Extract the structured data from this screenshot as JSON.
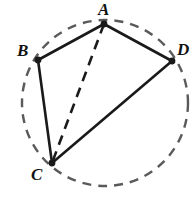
{
  "figure": {
    "name": "cyclic-quadrilateral-with-diagonal",
    "width": 193,
    "height": 197,
    "background_color": "#ffffff",
    "circle": {
      "name": "circumscribed-circle",
      "style": "dashed",
      "color": "#5a5a5a",
      "stroke_width": 2.4,
      "dash_pattern": "9 7",
      "center_x": 105,
      "center_y": 103,
      "radius": 83
    },
    "vertices": [
      {
        "id": "A",
        "label": "A",
        "x": 104,
        "y": 24,
        "label_x": 98,
        "label_y": 1,
        "dot_radius": 3.4,
        "color": "#1a1a1a"
      },
      {
        "id": "B",
        "label": "B",
        "x": 38,
        "y": 60,
        "label_x": 17,
        "label_y": 42,
        "dot_radius": 3.4,
        "color": "#1a1a1a"
      },
      {
        "id": "C",
        "label": "C",
        "x": 52,
        "y": 163,
        "label_x": 31,
        "label_y": 166,
        "dot_radius": 3.4,
        "color": "#1a1a1a"
      },
      {
        "id": "D",
        "label": "D",
        "x": 172,
        "y": 61,
        "label_x": 177,
        "label_y": 41,
        "dot_radius": 3.4,
        "color": "#1a1a1a"
      }
    ],
    "segments": [
      {
        "id": "AB",
        "from": "A",
        "to": "B",
        "style": "solid",
        "color": "#1a1a1a",
        "stroke_width": 2.6
      },
      {
        "id": "AD",
        "from": "A",
        "to": "D",
        "style": "solid",
        "color": "#1a1a1a",
        "stroke_width": 2.6
      },
      {
        "id": "BC",
        "from": "B",
        "to": "C",
        "style": "solid",
        "color": "#1a1a1a",
        "stroke_width": 2.6
      },
      {
        "id": "CD",
        "from": "C",
        "to": "D",
        "style": "solid",
        "color": "#1a1a1a",
        "stroke_width": 2.6
      },
      {
        "id": "AC",
        "from": "A",
        "to": "C",
        "style": "dashed",
        "color": "#1a1a1a",
        "stroke_width": 2.6,
        "dash_pattern": "10 7"
      }
    ]
  }
}
